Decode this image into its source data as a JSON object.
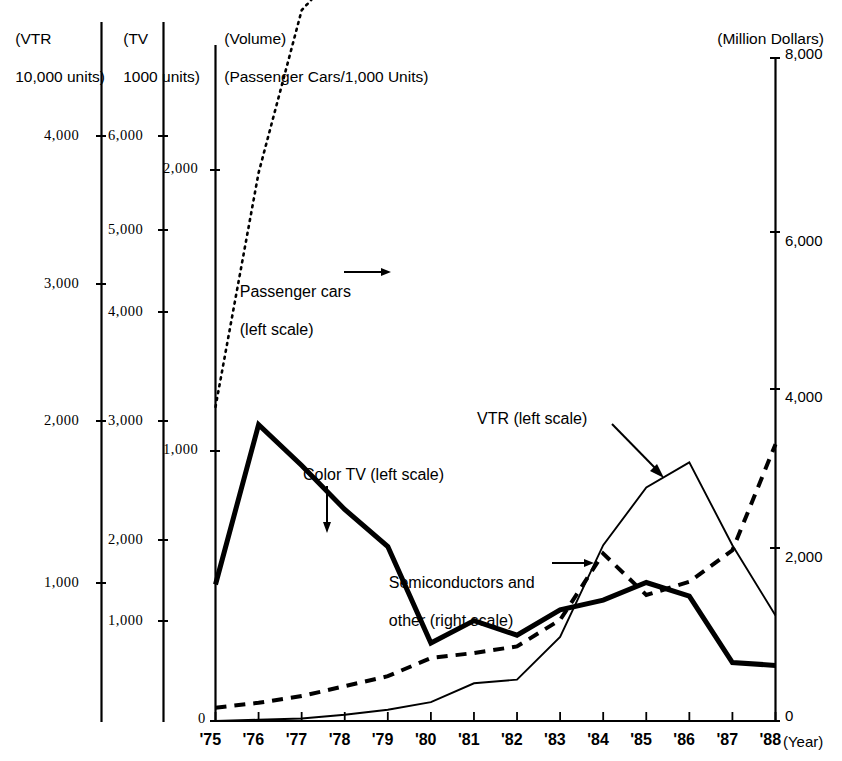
{
  "headers": {
    "vtr_unit_line1": "(VTR",
    "vtr_unit_line2": "10,000 units)",
    "tv_unit_line1": "(TV",
    "tv_unit_line2": "1000 units)",
    "volume_line1": "(Volume)",
    "volume_line2": "(Passenger Cars/1,000 Units)",
    "right_unit": "(Million Dollars)"
  },
  "annotations": {
    "passenger_cars": "Passenger cars",
    "passenger_cars_scale": "(left scale)",
    "color_tv": "Color TV (left scale)",
    "vtr": "VTR (left scale)",
    "semiconductors_l1": "Semiconductors and",
    "semiconductors_l2": "other (right scale)"
  },
  "axes": {
    "vtr_ticks": [
      "4,000",
      "3,000",
      "2,000",
      "1,000"
    ],
    "tv_ticks": [
      "6,000",
      "5,000",
      "4,000",
      "3,000",
      "2,000",
      "1,000"
    ],
    "volume_ticks": [
      "2,000",
      "1,000",
      "0"
    ],
    "right_ticks": [
      "8,000",
      "6,000",
      "4,000",
      "2,000",
      "0"
    ],
    "x_label": "(Year)",
    "x_ticks": [
      "'75",
      "'76",
      "'77",
      "'78",
      "'79",
      "'80",
      "'81",
      "'82",
      "'83",
      "'84",
      "'85",
      "'86",
      "'87",
      "'88"
    ]
  },
  "chart_data": {
    "type": "line",
    "title": "",
    "xlabel": "(Year)",
    "grid": false,
    "legend_position": "inline-annotations",
    "x": [
      1975,
      1976,
      1977,
      1978,
      1979,
      1980,
      1981,
      1982,
      1983,
      1984,
      1985,
      1986,
      1987,
      1988
    ],
    "categories": [
      "'75",
      "'76",
      "'77",
      "'78",
      "'79",
      "'80",
      "'81",
      "'82",
      "'83",
      "'84",
      "'85",
      "'86",
      "'87",
      "'88"
    ],
    "axis_left_vtr": {
      "label": "(VTR 10,000 units)",
      "ticks": [
        1000,
        2000,
        3000,
        4000
      ],
      "range": [
        0,
        4660
      ]
    },
    "axis_left_tv": {
      "label": "(TV 1000 units)",
      "ticks": [
        1000,
        2000,
        3000,
        4000,
        5000,
        6000
      ],
      "range": [
        0,
        6560
      ]
    },
    "axis_left_volume": {
      "label": "(Volume) (Passenger Cars/1,000 Units)",
      "ticks": [
        0,
        1000,
        2000
      ],
      "range": [
        0,
        2760
      ]
    },
    "axis_right": {
      "label": "(Million Dollars)",
      "ticks": [
        0,
        2000,
        4000,
        6000,
        8000
      ],
      "range": [
        0,
        8000
      ]
    },
    "series": [
      {
        "name": "Passenger cars (left scale)",
        "scale": "volume",
        "style": "dotted",
        "values": [
          1140,
          1990,
          2580,
          2750,
          3240,
          3660,
          3430,
          3400,
          3460,
          4120,
          4400,
          4640,
          4260,
          3900
        ],
        "units": "1,000 Units"
      },
      {
        "name": "Color TV (left scale)",
        "scale": "tv",
        "style": "thick-solid",
        "values": [
          1400,
          3040,
          2620,
          2170,
          1790,
          800,
          1030,
          880,
          1140,
          1240,
          1420,
          1280,
          600,
          570
        ],
        "units": "1000 units"
      },
      {
        "name": "VTR (left scale)",
        "scale": "vtr",
        "style": "thin-solid",
        "values": [
          0,
          10,
          20,
          50,
          90,
          150,
          300,
          330,
          670,
          1400,
          1860,
          2060,
          1400,
          840
        ],
        "units": "10,000 units"
      },
      {
        "name": "Semiconductors and other (right scale)",
        "scale": "right",
        "style": "dashed",
        "values": [
          160,
          220,
          300,
          420,
          540,
          760,
          820,
          900,
          1220,
          2020,
          1520,
          1680,
          2060,
          3340
        ],
        "units": "Million Dollars"
      }
    ]
  }
}
